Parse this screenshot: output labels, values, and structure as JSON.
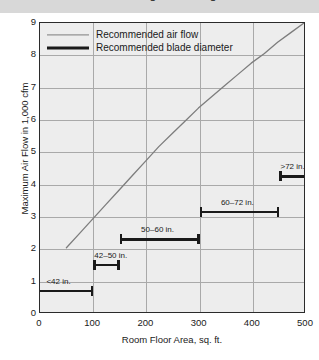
{
  "top_banner": {
    "clipped_text": "Recommended Ceiling Fan Sizing"
  },
  "chart_data": {
    "type": "line",
    "title": "",
    "xlabel": "Room Floor Area, sq. ft.",
    "ylabel": "Maximum Air Flow in 1,000 cfm",
    "xlim": [
      0,
      500
    ],
    "ylim": [
      0,
      9
    ],
    "xticks": [
      0,
      100,
      200,
      300,
      400,
      500
    ],
    "yticks": [
      0,
      1,
      2,
      3,
      4,
      5,
      6,
      7,
      8,
      9
    ],
    "grid": true,
    "legend_position": "top-left",
    "legend": [
      {
        "label": "Recommended air flow",
        "style": "thin-grey-line"
      },
      {
        "label": "Recommended blade diameter",
        "style": "thick-black-line"
      }
    ],
    "series": [
      {
        "name": "Recommended air flow",
        "type": "line",
        "color": "#7d7d7d",
        "x": [
          50,
          75,
          100,
          125,
          150,
          175,
          200,
          225,
          250,
          275,
          300,
          325,
          350,
          375,
          400,
          425,
          450,
          475,
          500
        ],
        "y": [
          2.0,
          2.45,
          2.9,
          3.35,
          3.8,
          4.25,
          4.7,
          5.15,
          5.55,
          5.95,
          6.35,
          6.7,
          7.05,
          7.4,
          7.75,
          8.05,
          8.4,
          8.7,
          9.0
        ]
      }
    ],
    "ranges": {
      "name": "Recommended blade diameter",
      "color": "#1a1a1a",
      "items": [
        {
          "label": "<42 in.",
          "x_start": 0,
          "x_end": 100,
          "y": 0.75,
          "cap_left": false,
          "cap_right": true,
          "label_x": 12
        },
        {
          "label": "42–50 in.",
          "x_start": 100,
          "x_end": 150,
          "y": 1.55,
          "cap_left": true,
          "cap_right": true,
          "label_x": 102
        },
        {
          "label": "50–60 in.",
          "x_start": 150,
          "x_end": 300,
          "y": 2.35,
          "cap_left": true,
          "cap_right": true,
          "label_x": 190
        },
        {
          "label": "60–72 in.",
          "x_start": 300,
          "x_end": 450,
          "y": 3.2,
          "cap_left": true,
          "cap_right": true,
          "label_x": 340
        },
        {
          "label": ">72 in.",
          "x_start": 450,
          "x_end": 510,
          "y": 4.3,
          "cap_left": true,
          "cap_right": false,
          "label_x": 452
        }
      ]
    }
  },
  "colors": {
    "banner_bg": "#d8d8d8",
    "plot_bg": "#ededed",
    "frame": "#2b2b2b",
    "grid": "#a9a9a9",
    "curve": "#7d7d7d",
    "bar": "#1a1a1a"
  }
}
